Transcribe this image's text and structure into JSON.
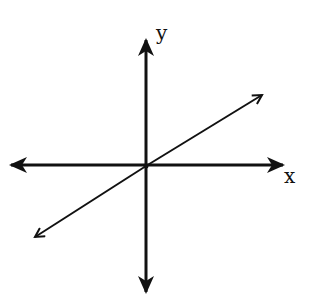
{
  "diagram": {
    "type": "coordinate-axes",
    "labels": {
      "x_axis": "x",
      "y_axis": "y"
    },
    "colors": {
      "stroke": "#111111",
      "background": "#ffffff"
    },
    "line": {
      "description": "straight line through origin with positive slope",
      "from": [
        35,
        237
      ],
      "to": [
        262,
        95
      ]
    }
  }
}
